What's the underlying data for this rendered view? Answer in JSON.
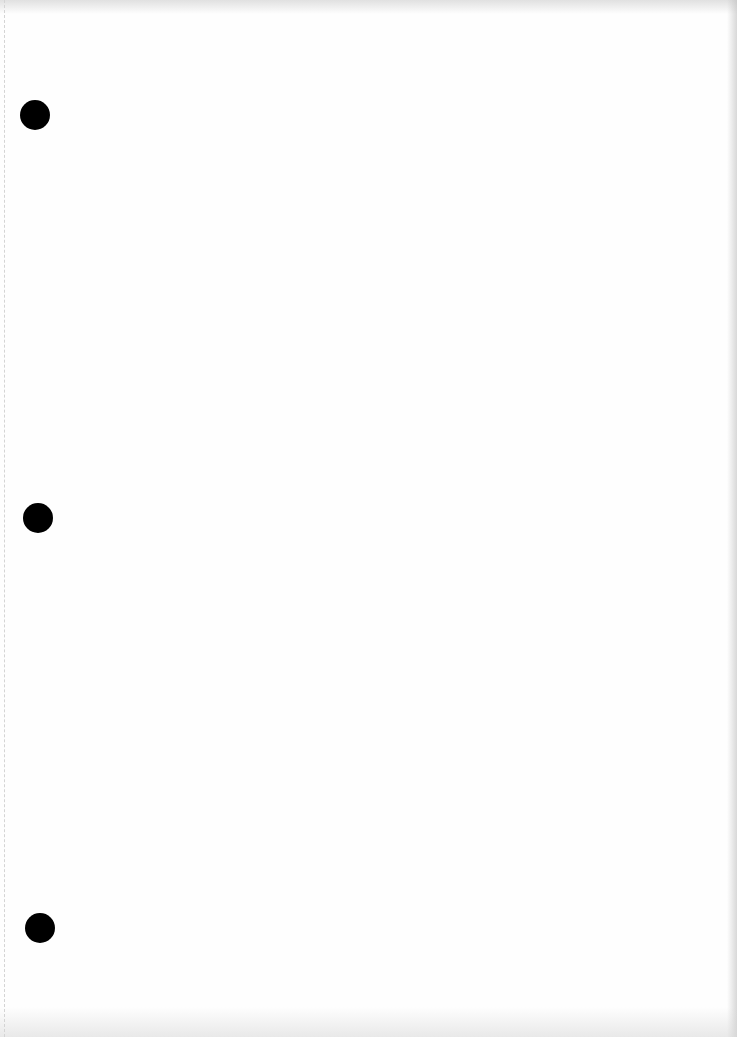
{
  "document": {
    "type": "blank loose-leaf paper (scanned)",
    "text_content": "",
    "background_color": "#fefefe",
    "margin_line": {
      "style": "dashed",
      "x": 4,
      "color": "#d4d4d4"
    },
    "binder_holes": [
      {
        "cx": 35,
        "cy": 115,
        "diameter": 30,
        "color": "#000000"
      },
      {
        "cx": 38,
        "cy": 518,
        "diameter": 30,
        "color": "#000000"
      },
      {
        "cx": 40,
        "cy": 928,
        "diameter": 30,
        "color": "#000000"
      }
    ]
  }
}
